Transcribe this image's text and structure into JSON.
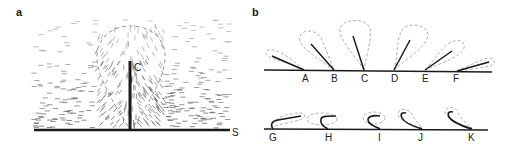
{
  "panels": {
    "a": {
      "label": "a",
      "rod_label": "C",
      "surface_label": "S"
    },
    "b": {
      "label": "b",
      "top_row": [
        {
          "label": "A",
          "base_x": 304,
          "tip_x": 272,
          "tip_y": 56
        },
        {
          "label": "B",
          "base_x": 334,
          "tip_x": 311,
          "tip_y": 44
        },
        {
          "label": "C",
          "base_x": 364,
          "tip_x": 353,
          "tip_y": 36
        },
        {
          "label": "D",
          "base_x": 394,
          "tip_x": 410,
          "tip_y": 40
        },
        {
          "label": "E",
          "base_x": 425,
          "tip_x": 452,
          "tip_y": 51
        },
        {
          "label": "F",
          "base_x": 457,
          "tip_x": 489,
          "tip_y": 62
        }
      ],
      "bottom_row": [
        {
          "label": "G"
        },
        {
          "label": "H"
        },
        {
          "label": "I"
        },
        {
          "label": "J"
        },
        {
          "label": "K"
        }
      ]
    }
  },
  "colors": {
    "line": "#1a1a1a",
    "dashed_outline": "#9a9a9a",
    "field_dash": "#555555"
  }
}
